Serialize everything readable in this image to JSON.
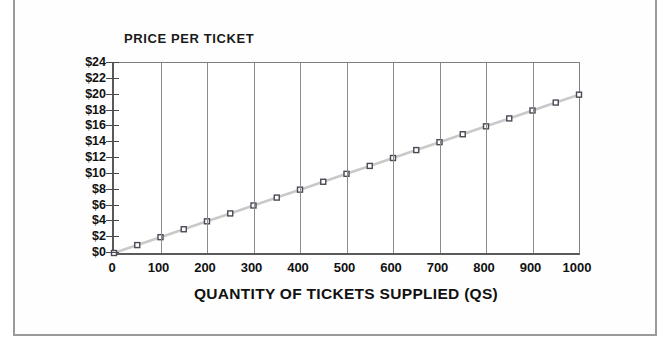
{
  "chart_data": {
    "type": "line",
    "title": "PRICE PER TICKET",
    "xlabel": "QUANTITY OF TICKETS SUPPLIED (QS)",
    "ylabel": "",
    "xlim": [
      0,
      1000
    ],
    "ylim": [
      0,
      24
    ],
    "grid": "vertical-only",
    "legend": "none",
    "x_tick_labels": [
      "0",
      "100",
      "200",
      "300",
      "400",
      "500",
      "600",
      "700",
      "800",
      "900",
      "1000"
    ],
    "x_ticks": [
      0,
      100,
      200,
      300,
      400,
      500,
      600,
      700,
      800,
      900,
      1000
    ],
    "y_tick_labels": [
      "$0",
      "$2",
      "$4",
      "$6",
      "$8",
      "$10",
      "$12",
      "$14",
      "$16",
      "$18",
      "$20",
      "$22",
      "$24"
    ],
    "y_ticks": [
      0,
      2,
      4,
      6,
      8,
      10,
      12,
      14,
      16,
      18,
      20,
      22,
      24
    ],
    "series": [
      {
        "name": "Supply",
        "marker": "square",
        "line_color": "#c9c9c9",
        "marker_color": "#4a4a56",
        "x": [
          0,
          50,
          100,
          150,
          200,
          250,
          300,
          350,
          400,
          450,
          500,
          550,
          600,
          650,
          700,
          750,
          800,
          850,
          900,
          950,
          1000
        ],
        "values": [
          0,
          1,
          2,
          3,
          4,
          5,
          6,
          7,
          8,
          9,
          10,
          11,
          12,
          13,
          14,
          15,
          16,
          17,
          18,
          19,
          20
        ]
      }
    ]
  },
  "footer": {
    "caption": ""
  },
  "colors": {
    "line": "#c9c9c9",
    "marker": "#4a4a56",
    "grid": "#8c8c8c",
    "axis": "#5a5a5a",
    "text": "#111111",
    "frame": "#9a9a9a"
  }
}
